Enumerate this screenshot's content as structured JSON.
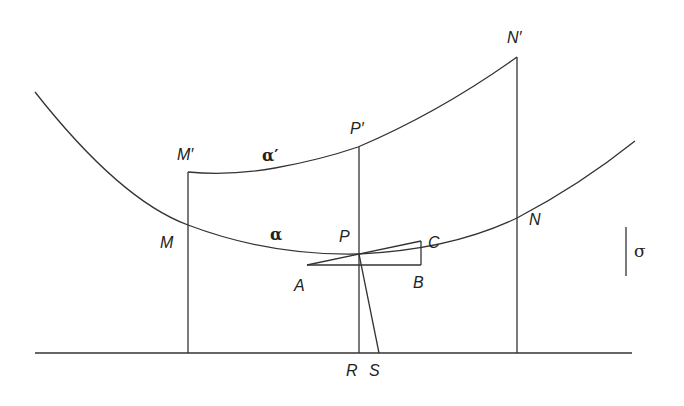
{
  "diagram": {
    "labels": {
      "M_prime": "M′",
      "N_prime": "N′",
      "P_prime": "P′",
      "alpha_prime": "α′",
      "M": "M",
      "N": "N",
      "P": "P",
      "alpha": "α",
      "A": "A",
      "B": "B",
      "C": "C",
      "R": "R",
      "S": "S",
      "sigma": "σ"
    },
    "colors": {
      "line": "#333333",
      "background": "#ffffff"
    }
  }
}
